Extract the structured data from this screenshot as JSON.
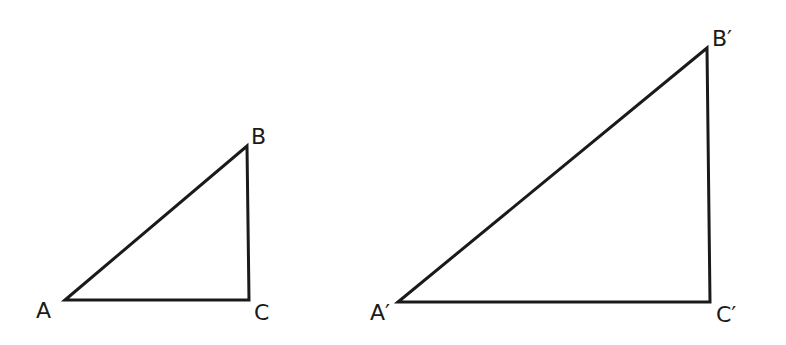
{
  "figure": {
    "stroke_color": "#1a1a1a",
    "background": "#ffffff",
    "triangles": [
      {
        "name": "ABC",
        "vertices": {
          "A": {
            "label": "A",
            "x": 65,
            "y": 300
          },
          "B": {
            "label": "B",
            "x": 247,
            "y": 146
          },
          "C": {
            "label": "C",
            "x": 249,
            "y": 300
          }
        },
        "label_positions": {
          "A": {
            "x": 36,
            "y": 318
          },
          "B": {
            "x": 251,
            "y": 144
          },
          "C": {
            "x": 254,
            "y": 320
          }
        }
      },
      {
        "name": "A'B'C'",
        "vertices": {
          "A": {
            "label": "A′",
            "x": 398,
            "y": 302
          },
          "B": {
            "label": "B′",
            "x": 707,
            "y": 48
          },
          "C": {
            "label": "C′",
            "x": 710,
            "y": 302
          }
        },
        "label_positions": {
          "A": {
            "x": 370,
            "y": 320
          },
          "B": {
            "x": 712,
            "y": 46
          },
          "C": {
            "x": 716,
            "y": 322
          }
        }
      }
    ]
  }
}
